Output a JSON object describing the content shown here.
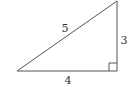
{
  "diagram": {
    "type": "right-triangle",
    "hypotenuse_label": "5",
    "vertical_leg_label": "3",
    "base_label": "4",
    "right_angle_marker": true,
    "stroke_color": "#555555",
    "vertices": {
      "bottom_left": [
        17,
        71
      ],
      "bottom_right": [
        117,
        71
      ],
      "top_right": [
        117,
        1
      ]
    }
  }
}
